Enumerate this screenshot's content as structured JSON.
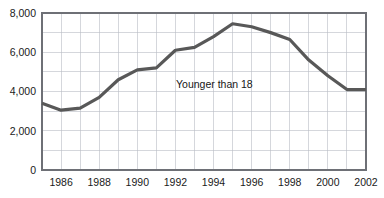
{
  "chart_data": {
    "type": "line",
    "title": "",
    "xlabel": "",
    "ylabel": "",
    "annotation": "Younger than 18",
    "series_name": "Younger than 18",
    "line_color": "#585858",
    "grid": true,
    "legend_position": "inline-annotation",
    "xlim": [
      1985,
      2002
    ],
    "ylim": [
      0,
      8000
    ],
    "y_ticks": [
      0,
      2000,
      4000,
      6000,
      8000
    ],
    "y_tick_labels": [
      "0",
      "2,000",
      "4,000",
      "6,000",
      "8,000"
    ],
    "x_ticks": [
      1986,
      1988,
      1990,
      1992,
      1994,
      1996,
      1998,
      2000,
      2002
    ],
    "x_tick_labels": [
      "1986",
      "1988",
      "1990",
      "1992",
      "1994",
      "1996",
      "1998",
      "2000",
      "2002"
    ],
    "x_minor_gridlines": [
      1985,
      1986,
      1987,
      1988,
      1989,
      1990,
      1991,
      1992,
      1993,
      1994,
      1995,
      1996,
      1997,
      1998,
      1999,
      2000,
      2001,
      2002
    ],
    "x": [
      1985,
      1986,
      1987,
      1988,
      1989,
      1990,
      1991,
      1992,
      1993,
      1994,
      1995,
      1996,
      1997,
      1998,
      1999,
      2000,
      2001,
      2002
    ],
    "values": [
      3400,
      3050,
      3150,
      3700,
      4600,
      5100,
      5200,
      6100,
      6250,
      6800,
      7450,
      7300,
      7000,
      6650,
      5600,
      4800,
      4100,
      4100
    ],
    "series": [
      {
        "name": "Younger than 18",
        "color": "#585858",
        "values": [
          3400,
          3050,
          3150,
          3700,
          4600,
          5100,
          5200,
          6100,
          6250,
          6800,
          7450,
          7300,
          7000,
          6650,
          5600,
          4800,
          4100,
          4100
        ]
      }
    ]
  },
  "plot": {
    "grid_color": "#b9bcc4",
    "frame_color": "#6e7076",
    "background": "#ffffff"
  }
}
